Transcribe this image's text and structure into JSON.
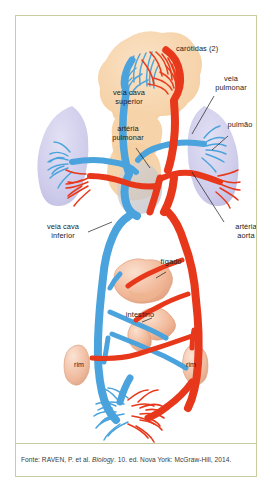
{
  "credit": "Estúdio Ornitorrinco",
  "caption": {
    "prefix": "Fonte: RAVEN, P. et al. ",
    "italic": "Biology",
    "suffix": ". 10. ed. Nova York: McGraw-Hill, 2014."
  },
  "figure": {
    "labels": [
      {
        "id": "carotidas",
        "text": "carótidas (2)",
        "x": 172,
        "y": 33,
        "align": "left"
      },
      {
        "id": "veia-cava-superior",
        "text": "veia cava\nsuperior",
        "x": 113,
        "y": 80,
        "align": "center"
      },
      {
        "id": "veia-pulmonar",
        "text": "veia\npulmonar",
        "x": 216,
        "y": 64,
        "align": "center"
      },
      {
        "id": "pulmao",
        "text": "pulmão",
        "x": 226,
        "y": 111,
        "align": "center"
      },
      {
        "id": "arteria-pulmonar",
        "text": "artéria\npulmonar",
        "x": 112,
        "y": 117,
        "align": "center"
      },
      {
        "id": "veia-cava-inferior",
        "text": "veia cava\ninferior",
        "x": 48,
        "y": 213,
        "align": "center"
      },
      {
        "id": "arteria-aorta",
        "text": "artéria\naorta",
        "x": 234,
        "y": 214,
        "align": "center"
      },
      {
        "id": "figado",
        "text": "fígado",
        "x": 155,
        "y": 247,
        "align": "center"
      },
      {
        "id": "intestino",
        "text": "intestino",
        "x": 124,
        "y": 300,
        "align": "center"
      },
      {
        "id": "rim-esquerdo",
        "text": "rim",
        "x": 63,
        "y": 350,
        "align": "center"
      },
      {
        "id": "rim-direito",
        "text": "rim",
        "x": 175,
        "y": 350,
        "align": "center"
      }
    ],
    "colors": {
      "artery": "#e8381c",
      "artery_dark": "#cf2d13",
      "vein": "#4aa3dc",
      "vein_dark": "#2f8ccb",
      "head_tissue": "#f6d3a8",
      "lung_tissue": "#c9c8e8",
      "organ_tissue": "#f0b898",
      "organ_tissue_light": "#f7d8c4",
      "leader_line": "#1d1d1b",
      "frame_border": "#c8cc9e",
      "text": "#1d1d1b"
    },
    "structures": [
      "capilares da cabeça",
      "coração",
      "pulmão esquerdo",
      "pulmão direito",
      "fígado",
      "intestino",
      "rim esquerdo",
      "rim direito",
      "capilares do corpo"
    ]
  }
}
